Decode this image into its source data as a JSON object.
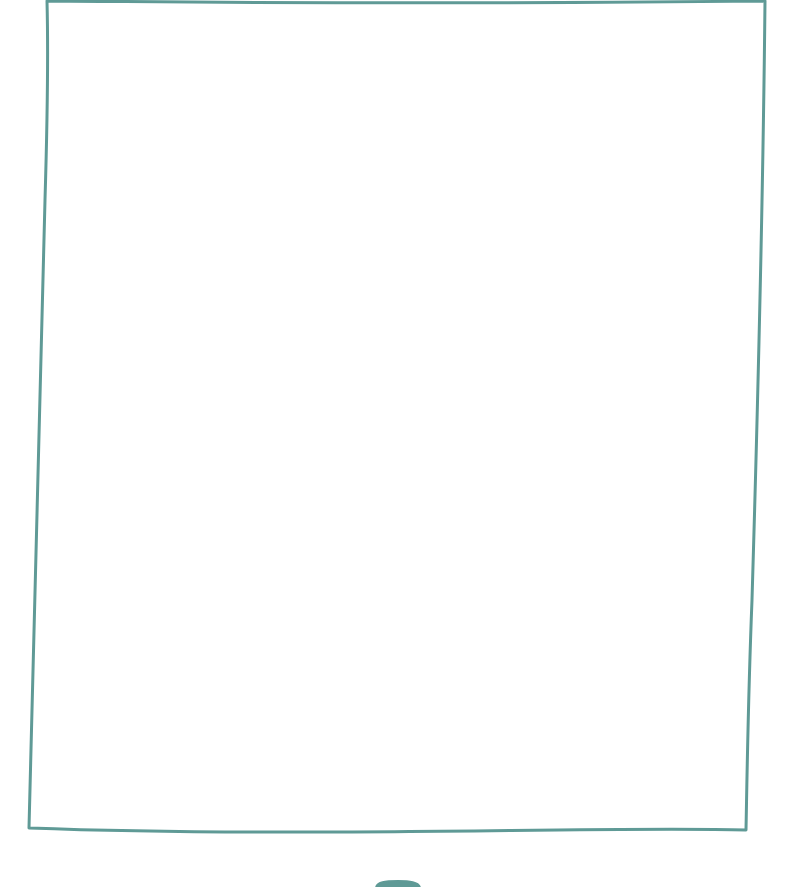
{
  "canvas": {
    "width": 790,
    "height": 887,
    "background": "#ffffff",
    "stroke_color": "#5f9a96",
    "content": ""
  },
  "frame": {
    "style": "hand-drawn rectangle",
    "label": ""
  },
  "bottom_tab": {
    "label": ""
  }
}
